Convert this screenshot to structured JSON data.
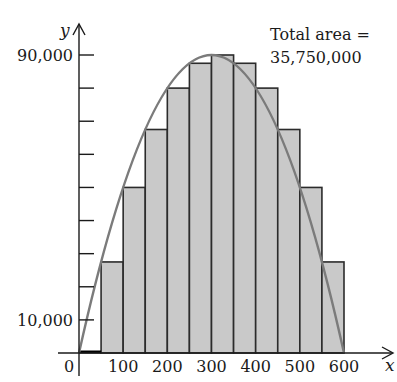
{
  "chart_data": {
    "type": "bar",
    "subtype": "riemann-sum-left-endpoints-with-curve",
    "title": "",
    "xlabel": "x",
    "ylabel": "y",
    "xlim": [
      0,
      600
    ],
    "ylim": [
      0,
      90000
    ],
    "x_tick_labels": [
      "0",
      "100",
      "200",
      "300",
      "400",
      "500",
      "600"
    ],
    "x_tick_values": [
      0,
      100,
      200,
      300,
      400,
      500,
      600
    ],
    "y_tick_values": [
      10000,
      20000,
      30000,
      40000,
      50000,
      60000,
      70000,
      80000,
      90000
    ],
    "y_labeled_ticks": [
      {
        "value": 90000,
        "label": "90,000"
      },
      {
        "value": 10000,
        "label": "10,000"
      }
    ],
    "bar_width": 50,
    "categories": [
      "0-50",
      "50-100",
      "100-150",
      "150-200",
      "200-250",
      "250-300",
      "300-350",
      "350-400",
      "400-450",
      "450-500",
      "500-550",
      "550-600"
    ],
    "bar_left_edges": [
      0,
      50,
      100,
      150,
      200,
      250,
      300,
      350,
      400,
      450,
      500,
      550
    ],
    "values": [
      0,
      27500,
      50000,
      67500,
      80000,
      87500,
      90000,
      87500,
      80000,
      67500,
      50000,
      27500
    ],
    "curve": {
      "description": "parabola y = x(600 - x)",
      "points": [
        [
          0,
          0
        ],
        [
          300,
          90000
        ],
        [
          600,
          0
        ]
      ]
    },
    "annotation": {
      "line1": "Total area =",
      "line2": "35,750,000"
    },
    "grid": false,
    "legend": null
  },
  "colors": {
    "bar_fill": "#c9c9c9",
    "bar_stroke": "#2b2b2b",
    "curve": "#7b7b7b",
    "axis": "#1a1a1a"
  }
}
